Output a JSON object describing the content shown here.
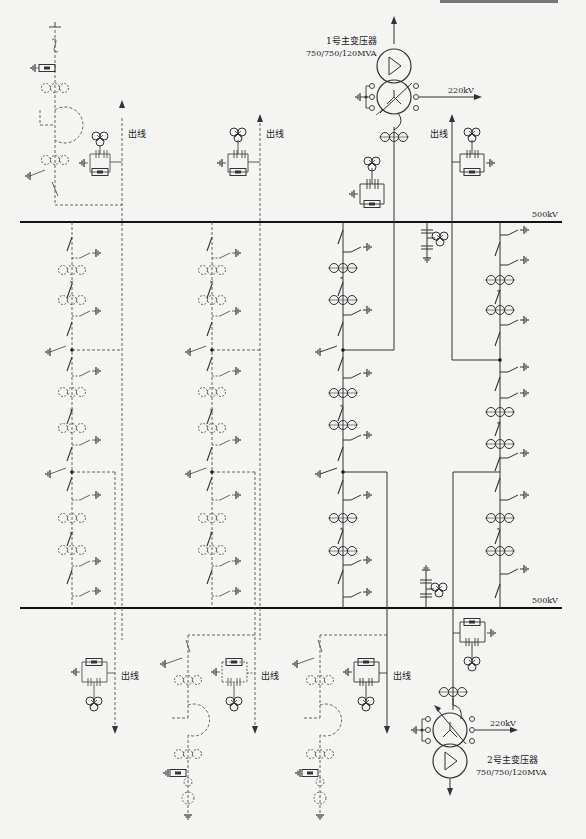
{
  "diagram": {
    "type": "single-line electrical diagram (one-and-a-half breaker 500kV substation)",
    "buses": [
      {
        "id": "bus-upper",
        "label": "500kV"
      },
      {
        "id": "bus-lower",
        "label": "500kV"
      }
    ],
    "transformers": [
      {
        "id": "tx1",
        "name": "1号主变压器",
        "rating": "750/750/120MVA",
        "lv_label": "220kV"
      },
      {
        "id": "tx2",
        "name": "2号主变压器",
        "rating": "750/750/120MVA",
        "lv_label": "220kV"
      }
    ],
    "outgoing_lines": [
      {
        "id": "line-1",
        "label": "出线",
        "style": "dashed"
      },
      {
        "id": "line-2",
        "label": "出线",
        "style": "dashed"
      },
      {
        "id": "line-3",
        "label": "出线",
        "style": "solid"
      },
      {
        "id": "line-4",
        "label": "出线",
        "style": "dashed"
      },
      {
        "id": "line-5",
        "label": "出线",
        "style": "dashed"
      },
      {
        "id": "line-6",
        "label": "出线",
        "style": "solid"
      }
    ],
    "bays": [
      {
        "id": "bay-1",
        "style": "dashed (future)"
      },
      {
        "id": "bay-2",
        "style": "dashed (future)"
      },
      {
        "id": "bay-3",
        "style": "solid"
      },
      {
        "id": "bay-4",
        "style": "solid"
      }
    ],
    "legend_icons": [
      "circuit-breaker-icon",
      "disconnector-icon",
      "earthing-switch-icon",
      "current-transformer-icon",
      "voltage-transformer-icon",
      "surge-arrester-icon",
      "coupling-capacitor-icon",
      "line-trap-icon",
      "reactor-icon",
      "ground-icon"
    ]
  }
}
